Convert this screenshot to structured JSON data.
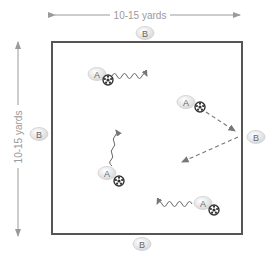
{
  "diagram": {
    "type": "soccer-drill-field",
    "dimensions": {
      "horizontal_label": "10-15 yards",
      "vertical_label": "10-15 yards"
    },
    "field": {
      "x": 52,
      "y": 42,
      "width": 190,
      "height": 192,
      "stroke": "#555555"
    },
    "colors": {
      "arrow": "#9a9a9a",
      "token_fill": "#e6e6e6",
      "token_text": "#666666",
      "ball": "#333333"
    },
    "players_b": [
      {
        "label": "B",
        "position": "top"
      },
      {
        "label": "B",
        "position": "left"
      },
      {
        "label": "B",
        "position": "right"
      },
      {
        "label": "B",
        "position": "bottom"
      }
    ],
    "players_a": [
      {
        "label": "A",
        "action": "dribble-right"
      },
      {
        "label": "A",
        "action": "pass-to-B-and-return"
      },
      {
        "label": "A",
        "action": "dribble-up"
      },
      {
        "label": "A",
        "action": "dribble-left"
      }
    ]
  }
}
